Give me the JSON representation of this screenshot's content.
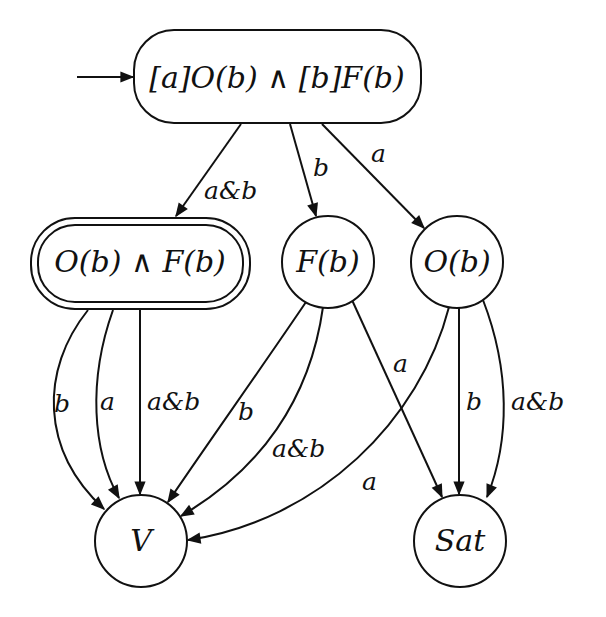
{
  "diagram": {
    "type": "state-automaton",
    "colors": {
      "ink": "#111111",
      "background": "#ffffff"
    },
    "initial_arrow": {
      "target": "init"
    },
    "nodes": {
      "init": {
        "label": "[a]O(b) ∧ [b]F(b)",
        "shape": "rounded-rect",
        "accepting": false,
        "initial": true
      },
      "ob_and_fb": {
        "label": "O(b) ∧ F(b)",
        "shape": "rounded-rect",
        "accepting": true,
        "initial": false
      },
      "fb": {
        "label": "F(b)",
        "shape": "circle",
        "accepting": false,
        "initial": false
      },
      "ob": {
        "label": "O(b)",
        "shape": "circle",
        "accepting": false,
        "initial": false
      },
      "v": {
        "label": "V",
        "shape": "circle",
        "accepting": false,
        "initial": false
      },
      "sat": {
        "label": "Sat",
        "shape": "circle",
        "accepting": false,
        "initial": false
      }
    },
    "edges": {
      "init_to_obfb": {
        "from": "init",
        "to": "ob_and_fb",
        "label": "a&b"
      },
      "init_to_fb": {
        "from": "init",
        "to": "fb",
        "label": "b"
      },
      "init_to_ob": {
        "from": "init",
        "to": "ob",
        "label": "a"
      },
      "obfb_to_v_b": {
        "from": "ob_and_fb",
        "to": "v",
        "label": "b"
      },
      "obfb_to_v_a": {
        "from": "ob_and_fb",
        "to": "v",
        "label": "a"
      },
      "obfb_to_v_ab": {
        "from": "ob_and_fb",
        "to": "v",
        "label": "a&b"
      },
      "fb_to_v_b": {
        "from": "fb",
        "to": "v",
        "label": "b"
      },
      "fb_to_v_ab": {
        "from": "fb",
        "to": "v",
        "label": "a&b"
      },
      "fb_to_sat_a": {
        "from": "fb",
        "to": "sat",
        "label": "a"
      },
      "ob_to_v_a": {
        "from": "ob",
        "to": "v",
        "label": "a"
      },
      "ob_to_sat_b": {
        "from": "ob",
        "to": "sat",
        "label": "b"
      },
      "ob_to_sat_ab": {
        "from": "ob",
        "to": "sat",
        "label": "a&b"
      }
    }
  }
}
